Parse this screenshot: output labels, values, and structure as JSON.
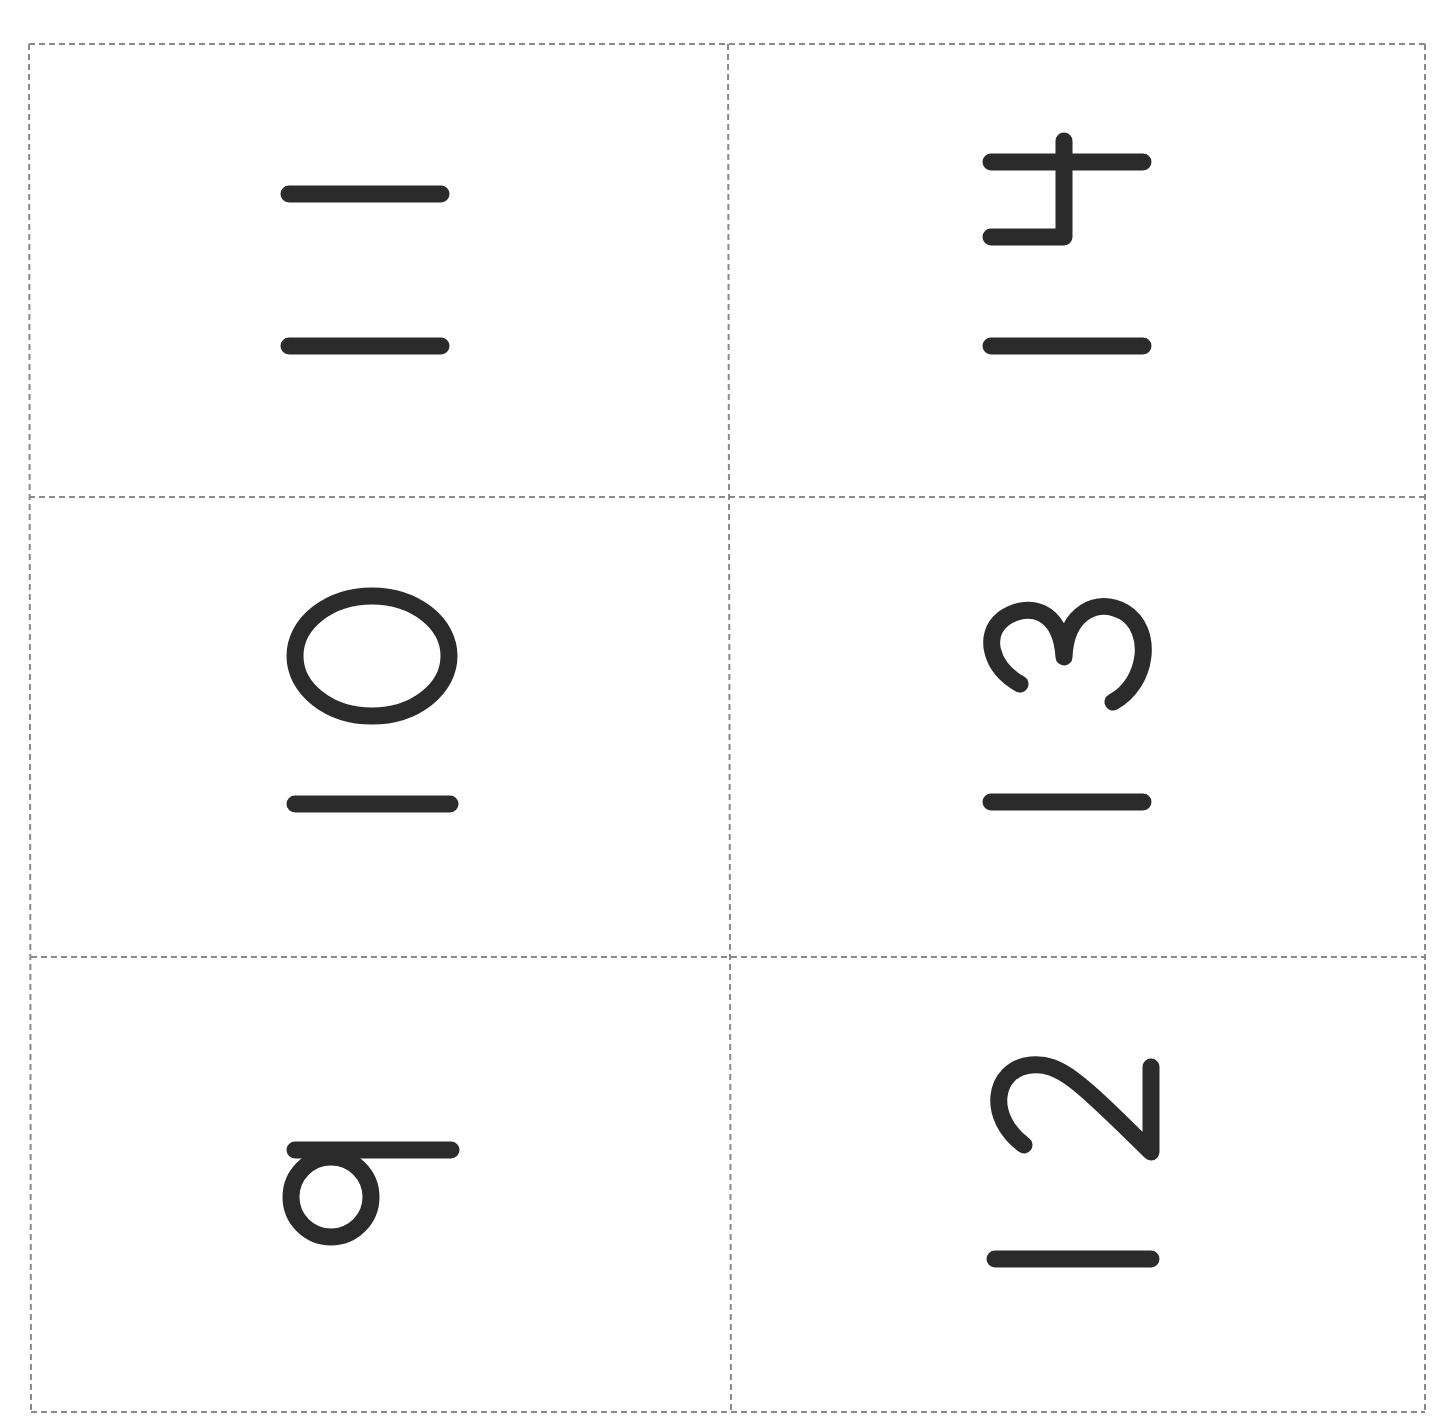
{
  "sheet": {
    "title": "Number cards",
    "orientation": "digits rotated 90° clockwise",
    "line_color": "#8a8a8a",
    "ink_color": "#2b2b2b",
    "cards": [
      {
        "position": "row1-col1",
        "value": "11"
      },
      {
        "position": "row1-col2",
        "value": "14"
      },
      {
        "position": "row2-col1",
        "value": "10"
      },
      {
        "position": "row2-col2",
        "value": "13"
      },
      {
        "position": "row3-col1",
        "value": "9"
      },
      {
        "position": "row3-col2",
        "value": "12"
      }
    ]
  }
}
